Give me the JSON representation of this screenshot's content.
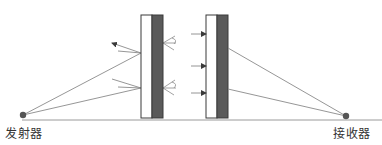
{
  "diagram": {
    "type": "signal-reflection-transmission-schematic",
    "labels": {
      "transmitter": "发射器",
      "receiver": "接收器"
    },
    "colors": {
      "background": "#ffffff",
      "outline": "#3a3a3a",
      "dark_panel": "#5a5a5a",
      "light_panel": "#ffffff",
      "ray": "#8a8a8a",
      "ground": "#9a9a9a",
      "endpoint": "#555555"
    },
    "elements": {
      "left_sample": {
        "white_layer": {
          "x": 141,
          "y": 15,
          "w": 11,
          "h": 103
        },
        "dark_layer": {
          "x": 152,
          "y": 15,
          "w": 11,
          "h": 103
        }
      },
      "right_sample": {
        "white_layer": {
          "x": 206,
          "y": 15,
          "w": 11,
          "h": 103
        },
        "dark_layer": {
          "x": 217,
          "y": 15,
          "w": 11,
          "h": 103
        }
      },
      "transmitter_point": {
        "x": 23,
        "y": 115
      },
      "receiver_point": {
        "x": 346,
        "y": 116
      },
      "ground_line": {
        "x1": 22,
        "y1": 120,
        "x2": 382,
        "y2": 120
      }
    }
  }
}
